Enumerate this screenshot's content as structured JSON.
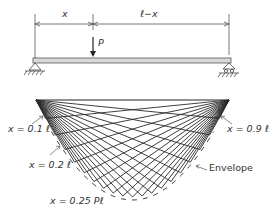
{
  "beam": {
    "dim_left": "x",
    "dim_right": "ℓ−x",
    "load": "P"
  },
  "diagram": {
    "labels": {
      "x01": "x = 0.1 ℓ",
      "x02": "x = 0.2 ℓ",
      "x09": "x = 0.9 ℓ",
      "max": "x = 0.25 Pℓ",
      "envelope": "Envelope"
    },
    "positions": [
      0.05,
      0.1,
      0.15,
      0.2,
      0.25,
      0.3,
      0.35,
      0.4,
      0.45,
      0.5,
      0.55,
      0.6,
      0.65,
      0.7,
      0.75,
      0.8,
      0.85,
      0.9,
      0.95
    ],
    "colors": {
      "line": "#2a2a2a",
      "beam_fill": "#d9d9d9",
      "text": "#333333"
    }
  }
}
